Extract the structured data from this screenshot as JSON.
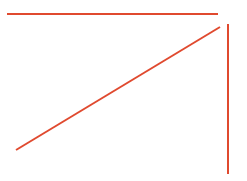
{
  "canvas": {
    "width": 247,
    "height": 181,
    "background_color": "#ffffff",
    "title": "Three-stroke red line sketch"
  },
  "style": {
    "stroke_color": "#e04a2f",
    "stroke_width": 2,
    "line_cap": "butt"
  },
  "chart_data": {
    "type": "line",
    "xlabel": "",
    "ylabel": "",
    "xlim": [
      0,
      247
    ],
    "ylim": [
      0,
      181
    ],
    "grid": false,
    "legend": "none",
    "series": [
      {
        "name": "horizontal-line",
        "color": "#e04a2f",
        "x": [
          7,
          218
        ],
        "y": [
          14,
          14
        ]
      },
      {
        "name": "diagonal-line",
        "color": "#e04a2f",
        "x": [
          16,
          220
        ],
        "y": [
          150,
          27
        ]
      },
      {
        "name": "vertical-line",
        "color": "#e04a2f",
        "x": [
          228,
          228
        ],
        "y": [
          24,
          174
        ]
      }
    ]
  },
  "shapes": {
    "horizontal": {
      "label": "horizontal-line",
      "x1": 7,
      "y1": 14,
      "x2": 218,
      "y2": 14,
      "color": "#e04a2f",
      "width": 2
    },
    "diagonal": {
      "label": "diagonal-line",
      "x1": 16,
      "y1": 150,
      "x2": 220,
      "y2": 27,
      "color": "#e04a2f",
      "width": 2
    },
    "vertical": {
      "label": "vertical-line",
      "x1": 228,
      "y1": 24,
      "x2": 228,
      "y2": 174,
      "color": "#e04a2f",
      "width": 2
    }
  }
}
